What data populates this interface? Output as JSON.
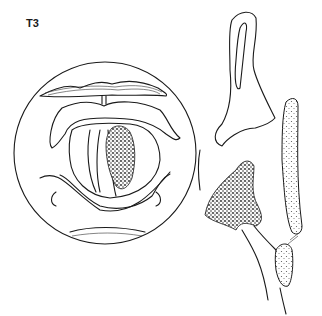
{
  "figure": {
    "stage_label": "T3",
    "views": [
      {
        "name": "laryngoscopic-view",
        "description": "Circular endoscopic view of larynx with tumor on vocal fold"
      },
      {
        "name": "sagittal-view",
        "description": "Sagittal section of larynx showing tumor extension"
      }
    ],
    "colors": {
      "line": "#1a1a1a",
      "background": "#ffffff",
      "tumor": "#3a3a3a"
    }
  }
}
